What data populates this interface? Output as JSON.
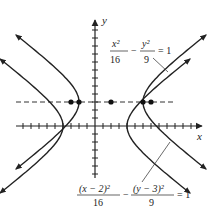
{
  "figure": {
    "axes": {
      "x_label": "x",
      "y_label": "y",
      "x_range": [
        -10,
        10
      ],
      "y_range": [
        -6,
        8
      ],
      "tick_spacing": 1
    },
    "curves": [
      {
        "name": "hyperbola-centered-origin",
        "equation": {
          "num1": "x²",
          "den1": "16",
          "minus": "−",
          "num2": "y²",
          "den2": "9",
          "rhs": "= 1"
        },
        "center": [
          0,
          0
        ],
        "a": 4,
        "b": 3
      },
      {
        "name": "hyperbola-shifted",
        "equation": {
          "num1": "(x − 2)²",
          "den1": "16",
          "minus": "−",
          "num2": "(y − 3)²",
          "den2": "9",
          "rhs": "= 1"
        },
        "center": [
          2,
          3
        ],
        "a": 4,
        "b": 3
      }
    ],
    "dashed_line_y": 3,
    "points": [
      {
        "x": -3,
        "y": 3,
        "label": "focus"
      },
      {
        "x": -2,
        "y": 3,
        "label": "vertex"
      },
      {
        "x": 2,
        "y": 3,
        "label": "center"
      },
      {
        "x": 6,
        "y": 3,
        "label": "vertex"
      },
      {
        "x": 7,
        "y": 3,
        "label": "focus"
      }
    ]
  }
}
